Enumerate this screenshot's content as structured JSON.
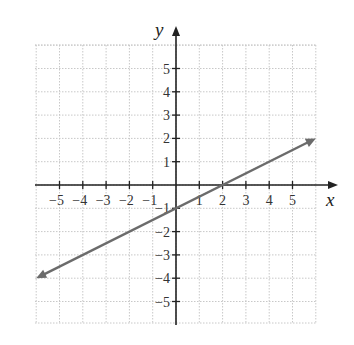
{
  "chart_data": {
    "type": "line",
    "title": "",
    "xlabel": "x",
    "ylabel": "y",
    "xlim": [
      -6,
      6
    ],
    "ylim": [
      -6,
      6
    ],
    "grid": true,
    "x_ticks": [
      -5,
      -4,
      -3,
      -2,
      -1,
      1,
      2,
      3,
      4,
      5
    ],
    "y_ticks": [
      5,
      4,
      3,
      2,
      1,
      -1,
      -2,
      -3,
      -4,
      -5
    ],
    "x_tick_labels": [
      "−5",
      "−4",
      "−3",
      "−2",
      "−1",
      "1",
      "2",
      "3",
      "4",
      "5"
    ],
    "y_tick_labels": [
      "5",
      "4",
      "3",
      "2",
      "1",
      "−1",
      "−2",
      "−3",
      "−4",
      "−5"
    ],
    "series": [
      {
        "name": "line",
        "equation": "y = x/2 - 1",
        "slope": 0.5,
        "y_intercept": -1,
        "x_intercept": 2,
        "x": [
          -6,
          6
        ],
        "y": [
          -4,
          2
        ],
        "arrows_both_ends": true,
        "color": "#6b6b6b"
      }
    ]
  },
  "style": {
    "axis_color": "#222222",
    "grid_color": "#c8c8c8",
    "line_color": "#6b6b6b"
  }
}
